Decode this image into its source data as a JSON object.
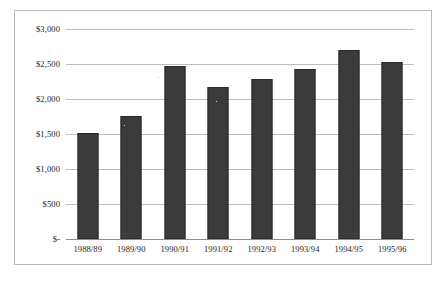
{
  "chart_data": {
    "type": "bar",
    "title": "",
    "xlabel": "",
    "ylabel": "",
    "categories": [
      "1988/89",
      "1989/90",
      "1990/91",
      "1991/92",
      "1992/93",
      "1993/94",
      "1994/95",
      "1995/96"
    ],
    "values": [
      1510,
      1760,
      2470,
      2170,
      2290,
      2430,
      2700,
      2530
    ],
    "ylim": [
      0,
      3000
    ],
    "ytick_values": [
      3000,
      2500,
      2000,
      1500,
      1000,
      500,
      0
    ],
    "ytick_labels": [
      "$3,000",
      "$2,500",
      "$2,000",
      "$1,500",
      "$1,000",
      "$500",
      "$-"
    ],
    "grid": true,
    "legend": false,
    "series": [
      {
        "name": "series-1",
        "values": [
          1510,
          1760,
          2470,
          2170,
          2290,
          2430,
          2700,
          2530
        ]
      }
    ],
    "colors": {
      "bar_fill": "#3b3b3b",
      "bar_border": "#2a2a2a",
      "gridline": "#bdbdbd",
      "baseline": "#8d8d8d",
      "frame_border": "#b9b9b9",
      "background": "#ffffff",
      "text": "#242424"
    }
  }
}
